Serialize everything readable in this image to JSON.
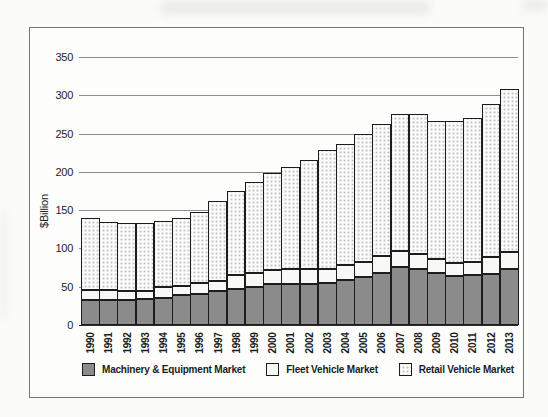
{
  "chart_data": {
    "type": "bar",
    "stacked": true,
    "title": "",
    "xlabel": "",
    "ylabel": "$Billion",
    "ylim": [
      0,
      350
    ],
    "ytick_step": 50,
    "grid": "horizontal",
    "legend_position": "bottom",
    "categories": [
      "1990",
      "1991",
      "1992",
      "1993",
      "1994",
      "1995",
      "1996",
      "1997",
      "1998",
      "1999",
      "2000",
      "2001",
      "2002",
      "2003",
      "2004",
      "2005",
      "2006",
      "2007",
      "2008",
      "2009",
      "2010",
      "2011",
      "2012",
      "2013"
    ],
    "series": [
      {
        "name": "Machinery & Equipment Market",
        "pattern": "solid",
        "color": "#8b8b8b",
        "values": [
          33,
          33,
          33,
          34,
          35,
          39,
          40,
          44,
          47,
          50,
          54,
          53,
          53,
          55,
          59,
          63,
          68,
          76,
          73,
          68,
          64,
          65,
          67,
          73
        ]
      },
      {
        "name": "Fleet Vehicle Market",
        "pattern": "solid",
        "color": "#f8f8f6",
        "values": [
          13,
          13,
          12,
          11,
          14,
          12,
          15,
          13,
          18,
          18,
          18,
          20,
          20,
          18,
          19,
          19,
          22,
          21,
          20,
          18,
          17,
          17,
          22,
          22
        ]
      },
      {
        "name": "Retail Vehicle Market",
        "pattern": "dotted",
        "color": "#fefefe",
        "dot_color": "#c4c4c4",
        "values": [
          94,
          89,
          88,
          88,
          87,
          89,
          92,
          105,
          110,
          119,
          126,
          133,
          143,
          155,
          159,
          168,
          173,
          179,
          183,
          180,
          185,
          188,
          200,
          213
        ]
      }
    ],
    "totals": [
      140,
      135,
      133,
      133,
      136,
      140,
      147,
      162,
      175,
      187,
      198,
      206,
      216,
      228,
      237,
      250,
      263,
      276,
      276,
      266,
      266,
      270,
      289,
      308
    ]
  },
  "colors": {
    "bar_border": "#1d1d1d",
    "gridline": "#8d8d8d",
    "axis_baseline": "#2b2b2b",
    "frame_border": "#747474",
    "text": "#1c1c1c"
  }
}
